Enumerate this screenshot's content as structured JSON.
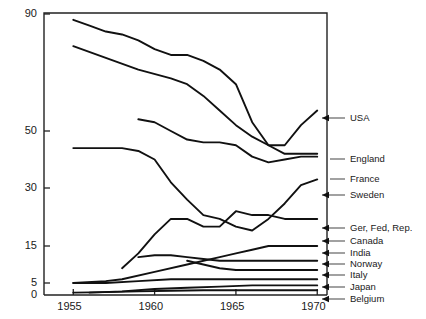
{
  "chart_data": {
    "type": "line",
    "title": "",
    "xlabel": "",
    "ylabel": "",
    "xlim": [
      1953.2,
      1970.6
    ],
    "ylim": [
      0,
      90
    ],
    "yscale": "custom-compressed",
    "grid": false,
    "legend_position": "right-arrows",
    "xticks": [
      1955,
      1960,
      1965,
      1970
    ],
    "xtick_labels": [
      "1955",
      "1960",
      "1965",
      "1970"
    ],
    "yticks": [
      0,
      5,
      15,
      30,
      50,
      90
    ],
    "ytick_labels": [
      "0",
      "5",
      "15",
      "30",
      "50",
      "90"
    ],
    "series": [
      {
        "name": "USA",
        "label": "USA",
        "x": [
          1955.0,
          1956.0,
          1957.0,
          1958.0,
          1959.0,
          1960.0,
          1961.0,
          1962.0,
          1963.0,
          1964.0,
          1965.0,
          1966.0,
          1967.0,
          1968.0,
          1969.0,
          1970.0
        ],
        "y": [
          88.0,
          86.0,
          84.0,
          83.0,
          81.0,
          78.0,
          76.0,
          76.0,
          74.0,
          71.0,
          66.0,
          53.0,
          45.0,
          45.0,
          52.0,
          57.0
        ]
      },
      {
        "name": "England",
        "label": "England",
        "x": [
          1955.0,
          1957.0,
          1959.0,
          1961.0,
          1962.0,
          1963.0,
          1964.0,
          1965.0,
          1966.0,
          1967.0,
          1968.0,
          1969.0,
          1970.0
        ],
        "y": [
          79.0,
          75.0,
          71.0,
          68.0,
          66.0,
          62.0,
          57.0,
          52.0,
          48.0,
          45.0,
          42.0,
          42.0,
          42.0
        ]
      },
      {
        "name": "France",
        "label": "France",
        "x": [
          1959.0,
          1960.0,
          1961.0,
          1962.0,
          1963.0,
          1964.0,
          1965.0,
          1966.0,
          1967.0,
          1968.0,
          1969.0,
          1970.0
        ],
        "y": [
          54.0,
          53.0,
          50.0,
          47.0,
          46.0,
          46.0,
          45.0,
          41.0,
          39.0,
          40.0,
          41.0,
          41.0
        ]
      },
      {
        "name": "Sweden",
        "label": "Sweden",
        "x": [
          1955.0,
          1957.0,
          1958.0,
          1959.0,
          1960.0,
          1961.0,
          1962.0,
          1963.0,
          1964.0,
          1965.0,
          1966.0,
          1967.0,
          1968.0,
          1969.0,
          1970.0
        ],
        "y": [
          44.0,
          44.0,
          44.0,
          43.0,
          40.0,
          32.0,
          27.0,
          23.0,
          22.0,
          20.0,
          19.0,
          22.0,
          26.0,
          31.0,
          33.0
        ]
      },
      {
        "name": "Ger, Fed, Rep.",
        "label": "Ger, Fed, Rep.",
        "x": [
          1958.0,
          1959.0,
          1960.0,
          1961.0,
          1962.0,
          1963.0,
          1964.0,
          1965.0,
          1966.0,
          1967.0,
          1968.0,
          1969.0,
          1970.0
        ],
        "y": [
          9.0,
          13.0,
          18.0,
          22.0,
          22.0,
          20.0,
          20.0,
          24.0,
          23.0,
          23.0,
          22.0,
          22.0,
          22.0
        ]
      },
      {
        "name": "Canada",
        "label": "Canada",
        "x": [
          1955.0,
          1957.0,
          1958.0,
          1960.0,
          1962.0,
          1964.0,
          1965.0,
          1966.0,
          1967.0,
          1968.0,
          1969.0,
          1970.0
        ],
        "y": [
          5.0,
          5.5,
          6.0,
          8.0,
          10.0,
          12.0,
          13.0,
          14.0,
          15.0,
          15.0,
          15.0,
          15.0
        ]
      },
      {
        "name": "India",
        "label": "India",
        "x": [
          1959.0,
          1960.0,
          1961.0,
          1962.0,
          1963.0,
          1964.0,
          1965.0,
          1966.0,
          1967.0,
          1968.0,
          1969.0,
          1970.0
        ],
        "y": [
          12.0,
          12.5,
          12.5,
          12.0,
          11.5,
          11.0,
          11.0,
          11.0,
          11.0,
          11.0,
          11.0,
          11.0
        ]
      },
      {
        "name": "Norway",
        "label": "Norway",
        "x": [
          1962.0,
          1963.0,
          1964.0,
          1965.0,
          1966.0,
          1967.0,
          1968.0,
          1969.0,
          1970.0
        ],
        "y": [
          11.0,
          10.0,
          9.0,
          8.5,
          8.5,
          8.5,
          8.5,
          8.5,
          8.5
        ]
      },
      {
        "name": "Italy",
        "label": "Italy",
        "x": [
          1955.0,
          1957.0,
          1959.0,
          1961.0,
          1963.0,
          1965.0,
          1967.0,
          1969.0,
          1970.0
        ],
        "y": [
          5.0,
          5.0,
          5.5,
          6.0,
          6.0,
          6.0,
          6.0,
          6.0,
          6.0
        ]
      },
      {
        "name": "Japan",
        "label": "Japan",
        "x": [
          1956.0,
          1958.0,
          1960.0,
          1962.0,
          1964.0,
          1966.0,
          1968.0,
          1970.0
        ],
        "y": [
          1.0,
          1.5,
          2.5,
          3.0,
          3.5,
          4.0,
          4.0,
          4.0
        ]
      },
      {
        "name": "Belgium",
        "label": "Belgium",
        "x": [
          1955.0,
          1957.0,
          1959.0,
          1961.0,
          1963.0,
          1965.0,
          1967.0,
          1969.0,
          1970.0
        ],
        "y": [
          1.0,
          1.2,
          1.5,
          1.8,
          2.0,
          2.0,
          2.0,
          2.0,
          2.0
        ]
      }
    ],
    "legend_entries": [
      {
        "label": "USA",
        "arrow": true,
        "y_px": 118
      },
      {
        "label": "England",
        "arrow": false,
        "y_px": 159
      },
      {
        "label": "France",
        "arrow": false,
        "y_px": 179
      },
      {
        "label": "Sweden",
        "arrow": true,
        "y_px": 195
      },
      {
        "label": "Ger, Fed, Rep.",
        "arrow": true,
        "y_px": 228
      },
      {
        "label": "Canada",
        "arrow": true,
        "y_px": 241
      },
      {
        "label": "India",
        "arrow": true,
        "y_px": 253
      },
      {
        "label": "Norway",
        "arrow": true,
        "y_px": 264
      },
      {
        "label": "Italy",
        "arrow": true,
        "y_px": 275
      },
      {
        "label": "Japan",
        "arrow": true,
        "y_px": 287
      },
      {
        "label": "Belgium",
        "arrow": true,
        "y_px": 299
      }
    ]
  },
  "style": {
    "line_color": "#111111",
    "axis_color": "#222222",
    "leader_color": "#555555",
    "background": "#ffffff"
  }
}
